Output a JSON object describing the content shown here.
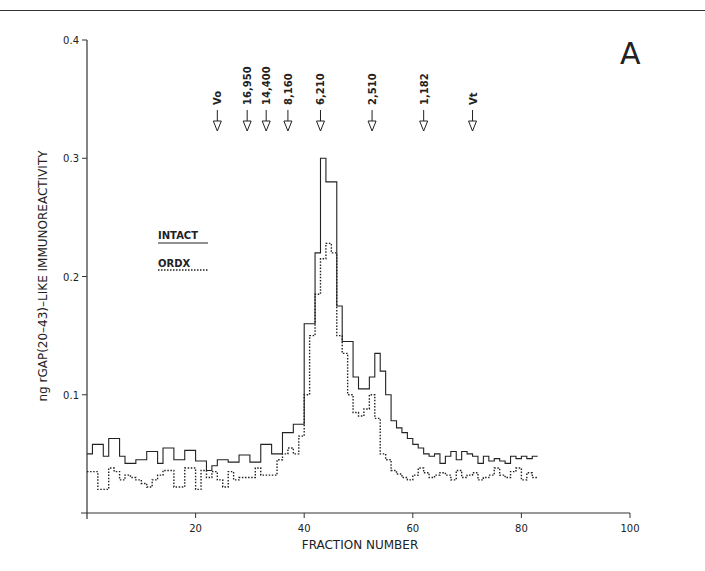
{
  "panel_label": "A",
  "chart_data": {
    "type": "line",
    "style": "step",
    "title": "",
    "panel": "A",
    "xlabel": "FRACTION NUMBER",
    "ylabel": "ng rGAP(20–43)–LIKE IMMUNOREACTIVITY",
    "xlim": [
      0,
      100
    ],
    "ylim": [
      0,
      0.4
    ],
    "xticks": [
      20,
      40,
      60,
      80,
      100
    ],
    "yticks": [
      0.1,
      0.2,
      0.3,
      0.4
    ],
    "ytick_labels": [
      "0.1",
      "0.2",
      "0.3",
      "0.4"
    ],
    "grid": false,
    "legend": [
      {
        "label": "INTACT",
        "linestyle": "solid"
      },
      {
        "label": "ORDX",
        "linestyle": "dotted"
      }
    ],
    "legend_position": "upper-left (inside, near x≈13–21, y≈0.20–0.23)",
    "calibration_markers": [
      {
        "label": "Vo",
        "fraction": 24
      },
      {
        "label": "16,950",
        "fraction": 29.5
      },
      {
        "label": "14,400",
        "fraction": 33
      },
      {
        "label": "8,160",
        "fraction": 37
      },
      {
        "label": "6,210",
        "fraction": 43
      },
      {
        "label": "2,510",
        "fraction": 52.5
      },
      {
        "label": "1,182",
        "fraction": 62
      },
      {
        "label": "Vt",
        "fraction": 71
      }
    ],
    "x": [
      0,
      1,
      2,
      3,
      4,
      5,
      6,
      7,
      8,
      9,
      10,
      11,
      12,
      13,
      14,
      15,
      16,
      17,
      18,
      19,
      20,
      21,
      22,
      23,
      24,
      25,
      26,
      27,
      28,
      29,
      30,
      31,
      32,
      33,
      34,
      35,
      36,
      37,
      38,
      39,
      40,
      41,
      42,
      43,
      44,
      45,
      46,
      47,
      48,
      49,
      50,
      51,
      52,
      53,
      54,
      55,
      56,
      57,
      58,
      59,
      60,
      61,
      62,
      63,
      64,
      65,
      66,
      67,
      68,
      69,
      70,
      71,
      72,
      73,
      74,
      75,
      76,
      77,
      78,
      79,
      80,
      81,
      82
    ],
    "series": [
      {
        "name": "INTACT",
        "linestyle": "solid",
        "values": [
          0.05,
          0.058,
          0.058,
          0.048,
          0.063,
          0.063,
          0.048,
          0.042,
          0.042,
          0.045,
          0.045,
          0.052,
          0.052,
          0.042,
          0.055,
          0.055,
          0.045,
          0.045,
          0.053,
          0.053,
          0.044,
          0.044,
          0.036,
          0.04,
          0.045,
          0.045,
          0.043,
          0.043,
          0.049,
          0.049,
          0.043,
          0.043,
          0.058,
          0.058,
          0.05,
          0.05,
          0.068,
          0.068,
          0.075,
          0.075,
          0.16,
          0.16,
          0.22,
          0.3,
          0.28,
          0.28,
          0.175,
          0.145,
          0.145,
          0.115,
          0.105,
          0.105,
          0.115,
          0.135,
          0.12,
          0.1,
          0.078,
          0.072,
          0.068,
          0.063,
          0.058,
          0.055,
          0.05,
          0.048,
          0.05,
          0.042,
          0.048,
          0.052,
          0.045,
          0.052,
          0.05,
          0.048,
          0.042,
          0.048,
          0.044,
          0.046,
          0.044,
          0.042,
          0.048,
          0.046,
          0.048,
          0.046,
          0.048
        ]
      },
      {
        "name": "ORDX",
        "linestyle": "dotted",
        "values": [
          0.035,
          0.035,
          0.02,
          0.02,
          0.038,
          0.035,
          0.028,
          0.032,
          0.03,
          0.028,
          0.025,
          0.022,
          0.028,
          0.032,
          0.036,
          0.036,
          0.022,
          0.022,
          0.038,
          0.038,
          0.02,
          0.036,
          0.03,
          0.035,
          0.028,
          0.022,
          0.035,
          0.028,
          0.03,
          0.03,
          0.03,
          0.038,
          0.032,
          0.032,
          0.032,
          0.045,
          0.05,
          0.055,
          0.05,
          0.065,
          0.1,
          0.15,
          0.185,
          0.215,
          0.228,
          0.22,
          0.15,
          0.135,
          0.1,
          0.085,
          0.082,
          0.088,
          0.1,
          0.08,
          0.05,
          0.045,
          0.036,
          0.033,
          0.03,
          0.028,
          0.032,
          0.038,
          0.034,
          0.03,
          0.032,
          0.034,
          0.032,
          0.028,
          0.036,
          0.03,
          0.032,
          0.034,
          0.028,
          0.03,
          0.032,
          0.038,
          0.032,
          0.03,
          0.035,
          0.038,
          0.028,
          0.034,
          0.03
        ]
      }
    ]
  }
}
